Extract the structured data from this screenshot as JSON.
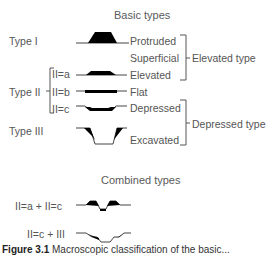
{
  "headings": {
    "basic": "Basic types",
    "combined": "Combined types"
  },
  "types": {
    "type1": "Type I",
    "type2": "Type II",
    "type3": "Type III"
  },
  "subtypes": {
    "iia": "II=a",
    "iib": "II=b",
    "iic": "II=c"
  },
  "descriptors": {
    "protruded": "Protruded",
    "superficial": "Superficial",
    "elevated": "Elevated",
    "flat": "Flat",
    "depressed": "Depressed",
    "excavated": "Excavated"
  },
  "groups": {
    "elevated_type": "Elevated type",
    "depressed_type": "Depressed type"
  },
  "combined": {
    "c1": "II=a + II=c",
    "c2": "II=c + III"
  },
  "caption": {
    "label": "Figure 3.1",
    "text": "Macroscopic classification of the basic..."
  },
  "colors": {
    "ink": "#000000",
    "line": "#555555",
    "text": "#555555"
  }
}
